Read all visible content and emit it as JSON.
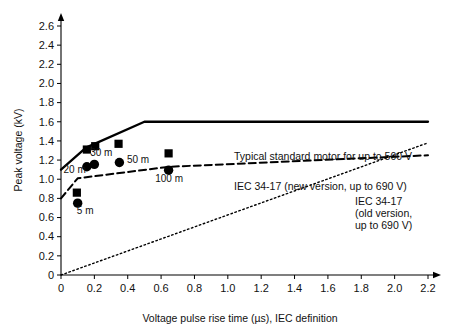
{
  "chart_data": {
    "type": "scatter",
    "title": "",
    "xlabel": "Voltage pulse rise time (µs), IEC definition",
    "ylabel": "Peak voltage (kV)",
    "xlim": [
      0,
      2.2
    ],
    "ylim": [
      0,
      2.6
    ],
    "xticks": [
      "0",
      "0.2",
      "0.4",
      "0.6",
      "0.8",
      "1.0",
      "1.2",
      "1.4",
      "1.6",
      "1.8",
      "2.0",
      "2.2"
    ],
    "xtick_values": [
      0,
      0.2,
      0.4,
      0.6,
      0.8,
      1.0,
      1.2,
      1.4,
      1.6,
      1.8,
      2.0,
      2.2
    ],
    "yticks": [
      "0",
      "0.2",
      "0.4",
      "0.6",
      "0.8",
      "1.0",
      "1.2",
      "1.4",
      "1.6",
      "1.8",
      "2.0",
      "2.2",
      "2.4",
      "2.6"
    ],
    "ytick_values": [
      0,
      0.2,
      0.4,
      0.6,
      0.8,
      1.0,
      1.2,
      1.4,
      1.6,
      1.8,
      2.0,
      2.2,
      2.4,
      2.6
    ],
    "grid": false,
    "legend_position": "inline-right",
    "series": [
      {
        "name": "Typical standard motor for up to 500 V",
        "style": "solid",
        "color": "#000000",
        "points": [
          [
            0.0,
            1.1
          ],
          [
            0.15,
            1.33
          ],
          [
            0.5,
            1.6
          ],
          [
            2.2,
            1.6
          ]
        ]
      },
      {
        "name": "IEC 34-17 (new version, up to 690 V)",
        "style": "dashed",
        "color": "#000000",
        "points": [
          [
            0.0,
            0.8
          ],
          [
            0.1,
            1.01
          ],
          [
            0.65,
            1.13
          ],
          [
            2.2,
            1.25
          ]
        ]
      },
      {
        "name": "IEC 34-17 (old version, up to 690 V)",
        "style": "dotted",
        "color": "#000000",
        "points": [
          [
            0.0,
            0.0
          ],
          [
            2.2,
            1.38
          ]
        ]
      }
    ],
    "measurements": {
      "square_marker_name": "square",
      "circle_marker_name": "circle",
      "squares": [
        {
          "label": "5 m",
          "x": 0.095,
          "y": 0.86
        },
        {
          "label": "20 m",
          "x": 0.155,
          "y": 1.31
        },
        {
          "label": "30 m",
          "x": 0.205,
          "y": 1.345
        },
        {
          "label": "50 m",
          "x": 0.345,
          "y": 1.37
        },
        {
          "label": "100 m",
          "x": 0.645,
          "y": 1.27
        }
      ],
      "circles": [
        {
          "label": "5 m",
          "x": 0.1,
          "y": 0.75
        },
        {
          "label": "20 m",
          "x": 0.155,
          "y": 1.13
        },
        {
          "label": "30 m",
          "x": 0.2,
          "y": 1.155
        },
        {
          "label": "50 m",
          "x": 0.35,
          "y": 1.175
        },
        {
          "label": "100 m",
          "x": 0.645,
          "y": 1.095
        }
      ]
    },
    "point_labels": [
      {
        "text": "5 m",
        "x": 0.095,
        "y": 0.64
      },
      {
        "text": "20 m",
        "x": 0.015,
        "y": 1.065
      },
      {
        "text": "30 m",
        "x": 0.175,
        "y": 1.245
      },
      {
        "text": "50 m",
        "x": 0.395,
        "y": 1.165
      },
      {
        "text": "100 m",
        "x": 0.565,
        "y": 0.975
      }
    ],
    "legend_entries": [
      {
        "id": "solid-legend",
        "lines": [
          "Typical standard motor for up to 500 V"
        ]
      },
      {
        "id": "dashed-legend",
        "lines": [
          "IEC 34-17 (new version, up to 690 V)"
        ]
      },
      {
        "id": "dotted-legend",
        "lines": [
          "IEC 34-17",
          "(old version,",
          "up to 690 V)"
        ]
      }
    ]
  },
  "colors": {
    "axis": "#000000",
    "curve": "#000000",
    "marker": "#000000",
    "background": "#ffffff"
  }
}
